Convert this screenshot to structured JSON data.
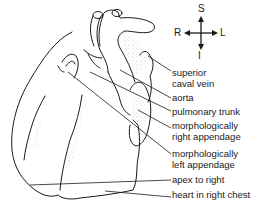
{
  "figure": {
    "compass": {
      "superior": "S",
      "inferior": "I",
      "right": "R",
      "left": "L"
    },
    "labels": [
      {
        "line1": "superior",
        "line2": "caval vein"
      },
      {
        "line1": "aorta"
      },
      {
        "line1": "pulmonary trunk"
      },
      {
        "line1": "morphologically",
        "line2": "right appendage"
      },
      {
        "line1": "morphologically",
        "line2": "left appendage"
      },
      {
        "line1": "apex to right"
      },
      {
        "line1": "heart in right chest"
      }
    ],
    "colors": {
      "ink": "#1a1a1a",
      "background": "#ffffff",
      "stipple": "#8a8a8a"
    }
  }
}
